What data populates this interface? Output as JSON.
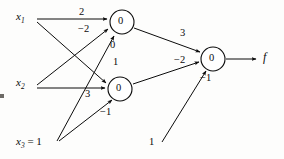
{
  "diagram": {
    "stroke_color": "#0b0b0b",
    "background_color": "#fdfdfc",
    "inputs": [
      {
        "id": "x1",
        "label": "x",
        "sub": "1",
        "x": 22,
        "y": 18
      },
      {
        "id": "x2",
        "label": "x",
        "sub": "2",
        "x": 22,
        "y": 84
      },
      {
        "id": "x3",
        "label": "x",
        "sub": "3",
        "suffix": " = 1",
        "x": 22,
        "y": 143
      }
    ],
    "nodes": [
      {
        "id": "h1",
        "value": "0",
        "cx": 122,
        "cy": 22,
        "r": 12
      },
      {
        "id": "h2",
        "value": "0",
        "cx": 120,
        "cy": 89,
        "r": 12
      },
      {
        "id": "out",
        "value": "0",
        "cx": 213,
        "cy": 59,
        "r": 12
      }
    ],
    "output": {
      "id": "f",
      "label": "f",
      "x": 265,
      "y": 58
    },
    "edges": [
      {
        "id": "x1-h1",
        "from": "x1",
        "to": "h1",
        "weight": "2",
        "wx": 82,
        "wy": 13
      },
      {
        "id": "x2-h1",
        "from": "x2",
        "to": "h1",
        "weight": "−2",
        "wx": 84,
        "wy": 30
      },
      {
        "id": "x3-h1",
        "from": "x3",
        "to": "h1",
        "weight": "0",
        "wx": 113,
        "wy": 45
      },
      {
        "id": "x1-h2",
        "from": "x1",
        "to": "h2",
        "weight": "1",
        "wx": 116,
        "wy": 63
      },
      {
        "id": "x2-h2",
        "from": "x2",
        "to": "h2",
        "weight": "3",
        "wx": 88,
        "wy": 95
      },
      {
        "id": "x3-h2",
        "from": "x3",
        "to": "h2",
        "weight": "−1",
        "wx": 105,
        "wy": 113
      },
      {
        "id": "h1-out",
        "from": "h1",
        "to": "out",
        "weight": "3",
        "wx": 183,
        "wy": 34
      },
      {
        "id": "h2-out",
        "from": "h2",
        "to": "out",
        "weight": "−2",
        "wx": 179,
        "wy": 61
      },
      {
        "id": "bias-out",
        "from": "x3",
        "to": "out",
        "weight": "−1",
        "wx": 205,
        "wy": 79
      },
      {
        "id": "bias-input",
        "from": "bias",
        "to": "out",
        "weight": "1",
        "wx": 152,
        "wy": 143
      }
    ]
  }
}
